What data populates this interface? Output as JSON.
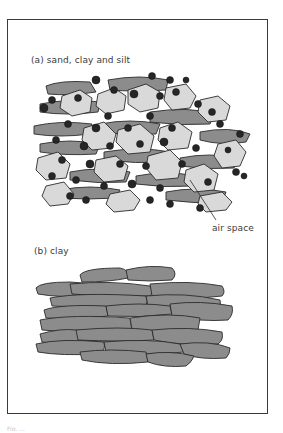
{
  "figure": {
    "panel_a": {
      "label": "(a) sand, clay and silt",
      "annotation": "air space"
    },
    "panel_b": {
      "label": "(b) clay"
    },
    "caption": "Fig. ..."
  },
  "legend_colors": {
    "sand": "#d9d9d9",
    "clay": "#8c8c8c",
    "silt": "#262626",
    "outline": "#2b2b2b",
    "frame": "#3a3a3a"
  }
}
